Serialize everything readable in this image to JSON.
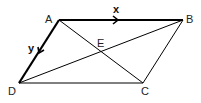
{
  "diagram": {
    "type": "parallelogram",
    "points": {
      "A": {
        "label": "A",
        "x": 59,
        "y": 20
      },
      "B": {
        "label": "B",
        "x": 183,
        "y": 20
      },
      "C": {
        "label": "C",
        "x": 143,
        "y": 83
      },
      "D": {
        "label": "D",
        "x": 19,
        "y": 83
      },
      "E": {
        "label": "E",
        "x": 101,
        "y": 52
      }
    },
    "vectors": {
      "x": {
        "label": "x",
        "from": "A",
        "to": "B"
      },
      "y": {
        "label": "y",
        "from": "A",
        "to": "D"
      }
    },
    "diagonals": [
      "AC",
      "BD"
    ],
    "colors": {
      "line": "#000000",
      "background": "#ffffff"
    }
  }
}
